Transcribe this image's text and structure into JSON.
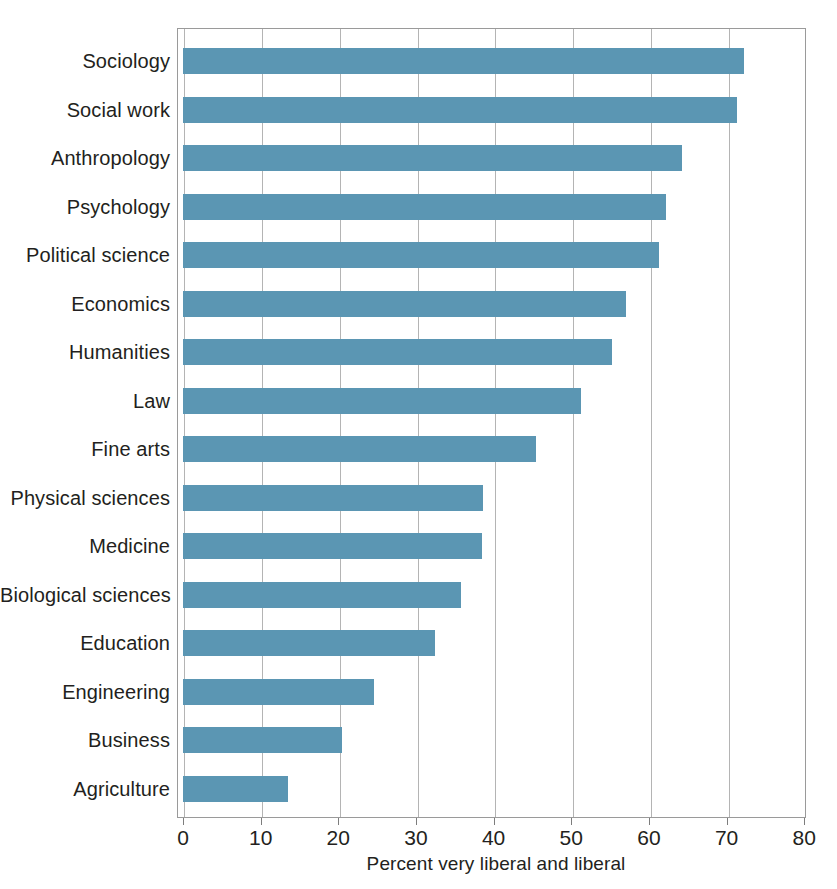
{
  "chart_data": {
    "type": "bar",
    "orientation": "horizontal",
    "title": "",
    "subtitle": "",
    "xlabel": "Percent very liberal and liberal",
    "ylabel": "",
    "xlim": [
      0,
      80
    ],
    "xticks": [
      0,
      10,
      20,
      30,
      40,
      50,
      60,
      70,
      80
    ],
    "xtick_labels": [
      "0",
      "10",
      "20",
      "30",
      "40",
      "50",
      "60",
      "70",
      "80"
    ],
    "grid": "vertical",
    "legend": "none",
    "bar_color": "#5b96b3",
    "categories": [
      "Sociology",
      "Social work",
      "Anthropology",
      "Psychology",
      "Political science",
      "Economics",
      "Humanities",
      "Law",
      "Fine arts",
      "Physical sciences",
      "Medicine",
      "Biological sciences",
      "Education",
      "Engineering",
      "Business",
      "Agriculture"
    ],
    "values": [
      72.3,
      71.3,
      64.3,
      62.2,
      61.3,
      57.0,
      55.2,
      51.3,
      45.5,
      38.6,
      38.5,
      35.8,
      32.5,
      24.6,
      20.5,
      13.5
    ]
  },
  "axis": {
    "x_title": "Percent very liberal and liberal"
  }
}
